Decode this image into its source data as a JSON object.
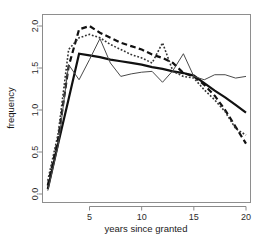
{
  "chart_data": {
    "type": "line",
    "title": "",
    "xlabel": "years since granted",
    "ylabel": "frequency",
    "xlim": [
      1,
      20
    ],
    "ylim": [
      0.0,
      2.15
    ],
    "grid": false,
    "legend": "none",
    "background": "#ffffff",
    "frame_color": "#8e8e8e",
    "xticks": [
      5,
      10,
      15,
      20
    ],
    "xtick_labels": [
      "5",
      "10",
      "15",
      "20"
    ],
    "yticks": [
      0.0,
      0.5,
      1.0,
      1.5,
      2.0
    ],
    "ytick_labels": [
      "0.0",
      "0.5",
      "1.0",
      "1.5",
      "2.0"
    ],
    "x": [
      1,
      2,
      3,
      4,
      5,
      6,
      7,
      8,
      9,
      10,
      11,
      12,
      13,
      14,
      15,
      16,
      17,
      18,
      19,
      20
    ],
    "series": [
      {
        "name": "thick-solid",
        "style": "solid",
        "width": 2.2,
        "color": "#111111",
        "values": [
          0.06,
          0.6,
          1.13,
          1.67,
          1.65,
          1.63,
          1.6,
          1.58,
          1.56,
          1.54,
          1.51,
          1.49,
          1.46,
          1.44,
          1.41,
          1.32,
          1.23,
          1.15,
          1.06,
          0.97
        ]
      },
      {
        "name": "dashed",
        "style": "dashed",
        "width": 2.2,
        "color": "#111111",
        "values": [
          0.1,
          0.66,
          1.52,
          1.96,
          2.0,
          1.92,
          1.86,
          1.8,
          1.76,
          1.72,
          1.66,
          1.62,
          1.56,
          1.44,
          1.4,
          1.3,
          1.17,
          1.0,
          0.8,
          0.6
        ]
      },
      {
        "name": "dotted",
        "style": "dotted",
        "width": 1.6,
        "color": "#333333",
        "values": [
          0.16,
          0.72,
          1.72,
          1.86,
          1.9,
          1.86,
          1.78,
          1.72,
          1.66,
          1.62,
          1.56,
          1.8,
          1.46,
          1.4,
          1.38,
          1.24,
          1.12,
          0.98,
          0.78,
          0.7
        ]
      },
      {
        "name": "thin-solid",
        "style": "solid",
        "width": 1.0,
        "color": "#4a4a4a",
        "values": [
          0.04,
          0.58,
          1.54,
          1.36,
          1.6,
          1.85,
          1.56,
          1.4,
          1.43,
          1.45,
          1.46,
          1.33,
          1.47,
          1.67,
          1.4,
          1.36,
          1.42,
          1.42,
          1.38,
          1.4
        ]
      }
    ]
  }
}
